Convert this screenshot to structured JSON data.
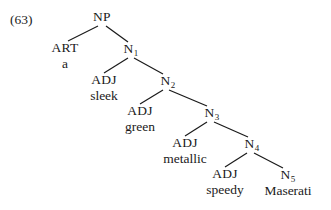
{
  "example_number": "(63)",
  "tree": {
    "root": {
      "label": "NP"
    },
    "art": {
      "cat": "ART",
      "word": "a"
    },
    "n1": {
      "cat": "N",
      "sub": "1"
    },
    "adj1": {
      "cat": "ADJ",
      "word": "sleek"
    },
    "n2": {
      "cat": "N",
      "sub": "2"
    },
    "adj2": {
      "cat": "ADJ",
      "word": "green"
    },
    "n3": {
      "cat": "N",
      "sub": "3"
    },
    "adj3": {
      "cat": "ADJ",
      "word": "metallic"
    },
    "n4": {
      "cat": "N",
      "sub": "4"
    },
    "adj4": {
      "cat": "ADJ",
      "word": "speedy"
    },
    "n5": {
      "cat": "N",
      "sub": "5",
      "word": "Maserati"
    }
  }
}
